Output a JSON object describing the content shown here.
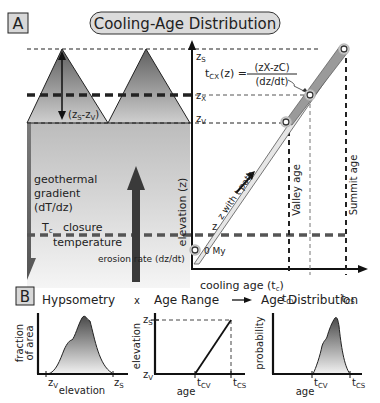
{
  "panel_a": {
    "label": "A",
    "title": "Cooling-Age Distribution",
    "relief_label": "(zS-zV)",
    "relief_z_main": "(z",
    "relief_sub_s": "S",
    "relief_dash": "-z",
    "relief_sub_v": "V",
    "relief_close": ")",
    "geothermal_line1": "geothermal",
    "geothermal_line2": "gradient",
    "geothermal_line3": "(dT/dz)",
    "tc_label": "T",
    "tc_sub": "c",
    "closure_line1": "closure",
    "closure_line2": "temperature",
    "erosion_label": "erosion rate (dz/dt)",
    "y_axis_label": "elevation (z)",
    "x_axis_label": "cooling age (t",
    "x_axis_sub": "c",
    "x_axis_close": ")",
    "zs": "z",
    "zs_sub": "S",
    "zx": "z",
    "zx_sub": "X",
    "zv": "z",
    "zv_sub": "V",
    "zc": "z",
    "zc_sub": "C",
    "zero_label": "0 My",
    "path_label": "z with t path",
    "valley_age": "Valley age",
    "summit_age": "Summit age",
    "tcv": "t",
    "tcv_sub": "CV",
    "tcs": "t",
    "tcs_sub": "CS",
    "formula_lhs": "t",
    "formula_lhs_sub": "CX",
    "formula_lhs_rest": "(z) =",
    "formula_num": "(zX-zC)",
    "formula_den": "(dz/dt)"
  },
  "panel_b": {
    "label": "B",
    "header_hypsometry": "Hypsometry",
    "header_times": "x",
    "header_age_range": "Age Range",
    "header_age_distribution": "Age Distribution",
    "hyps_ylabel_1": "fraction",
    "hyps_ylabel_2": "of area",
    "hyps_xlabel": "elevation",
    "hyps_zv": "z",
    "hyps_zv_sub": "V",
    "hyps_zs": "z",
    "hyps_zs_sub": "S",
    "range_ylabel": "elevation",
    "range_xlabel": "age",
    "range_zs": "z",
    "range_zs_sub": "S",
    "range_zv": "z",
    "range_zv_sub": "V",
    "range_tcv": "t",
    "range_tcv_sub": "CV",
    "range_tcs": "t",
    "range_tcs_sub": "CS",
    "dist_ylabel": "probability",
    "dist_xlabel": "age",
    "dist_tcv": "t",
    "dist_tcv_sub": "CV",
    "dist_tcs": "t",
    "dist_tcs_sub": "CS"
  },
  "colors": {
    "line": "#1a1a1a",
    "dash_gray": "#555555",
    "mountain_dark": "#6e6e6e",
    "mountain_light": "#c9c9c9",
    "crust_top": "#bdbdbd",
    "crust_bottom": "#f2f2f2",
    "arrow": "#3a3a3a",
    "path_fill": "#b5b5b5"
  }
}
